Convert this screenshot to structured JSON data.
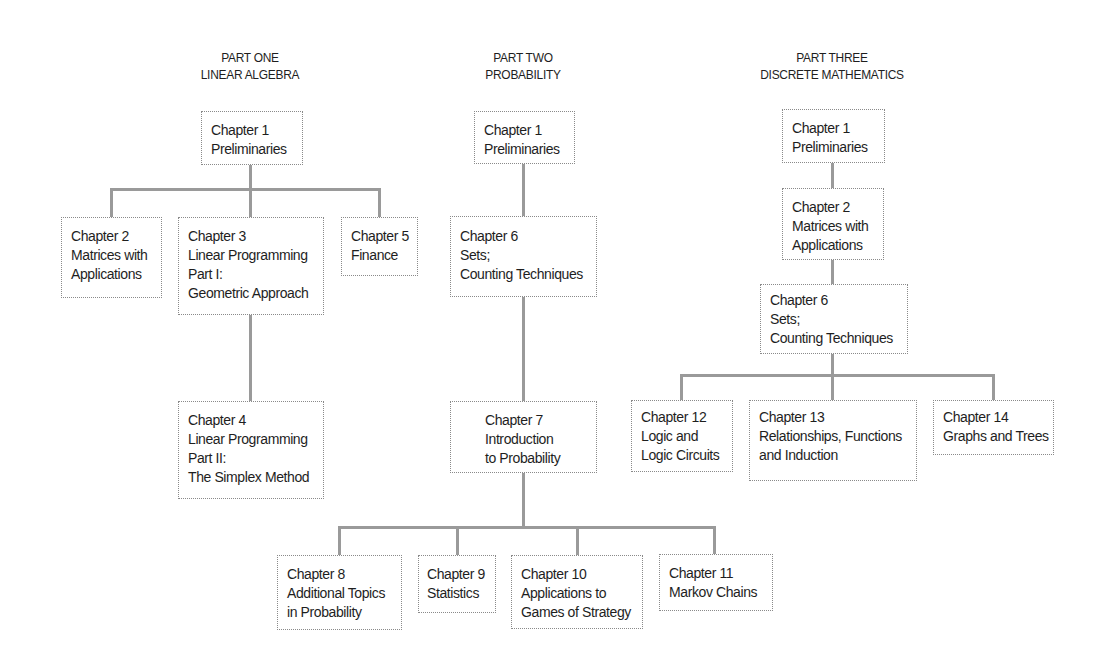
{
  "parts": [
    {
      "title": [
        "PART ONE",
        "LINEAR ALGEBRA"
      ],
      "chapters": {
        "ch1": [
          "Chapter 1",
          "Preliminaries"
        ],
        "ch2": [
          "Chapter 2",
          "Matrices with",
          "Applications"
        ],
        "ch3": [
          "Chapter 3",
          "Linear Programming",
          "Part I:",
          "Geometric Approach"
        ],
        "ch5": [
          "Chapter 5",
          "Finance"
        ],
        "ch4": [
          "Chapter 4",
          "Linear Programming",
          "Part II:",
          "The Simplex Method"
        ]
      }
    },
    {
      "title": [
        "PART TWO",
        "PROBABILITY"
      ],
      "chapters": {
        "ch1": [
          "Chapter 1",
          "Preliminaries"
        ],
        "ch6": [
          "Chapter 6",
          "Sets;",
          "Counting Techniques"
        ],
        "ch7": [
          "Chapter 7",
          "Introduction",
          "to Probability"
        ],
        "ch8": [
          "Chapter 8",
          "Additional Topics",
          "in Probability"
        ],
        "ch9": [
          "Chapter 9",
          "Statistics"
        ],
        "ch10": [
          "Chapter 10",
          "Applications to",
          "Games of Strategy"
        ],
        "ch11": [
          "Chapter 11",
          "Markov Chains"
        ]
      }
    },
    {
      "title": [
        "PART THREE",
        "DISCRETE MATHEMATICS"
      ],
      "chapters": {
        "ch1": [
          "Chapter 1",
          "Preliminaries"
        ],
        "ch2": [
          "Chapter 2",
          "Matrices with",
          "Applications"
        ],
        "ch6": [
          "Chapter 6",
          "Sets;",
          "Counting Techniques"
        ],
        "ch12": [
          "Chapter 12",
          "Logic and",
          "Logic Circuits"
        ],
        "ch13": [
          "Chapter 13",
          "Relationships, Functions",
          "and Induction"
        ],
        "ch14": [
          "Chapter 14",
          "Graphs and Trees"
        ]
      }
    }
  ],
  "colors": {
    "connector": "#9a9a9a",
    "box_border": "#8a8a8a",
    "text": "#1e1e1e"
  }
}
